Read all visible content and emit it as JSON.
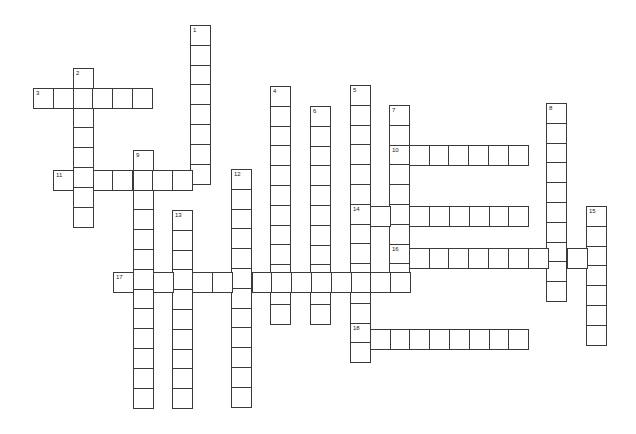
{
  "puzzle": {
    "type": "crossword",
    "cell_size": 19.8,
    "words": [
      {
        "number": "1",
        "direction": "down",
        "x": 191,
        "y": 26,
        "length": 8
      },
      {
        "number": "2",
        "direction": "down",
        "x": 74,
        "y": 69,
        "length": 8
      },
      {
        "number": "3",
        "direction": "across",
        "x": 34,
        "y": 89,
        "length": 6
      },
      {
        "number": "4",
        "direction": "down",
        "x": 271,
        "y": 87,
        "length": 12
      },
      {
        "number": "5",
        "direction": "down",
        "x": 351,
        "y": 86,
        "length": 14
      },
      {
        "number": "6",
        "direction": "down",
        "x": 311,
        "y": 107,
        "length": 11
      },
      {
        "number": "7",
        "direction": "down",
        "x": 390,
        "y": 106,
        "length": 9
      },
      {
        "number": "8",
        "direction": "down",
        "x": 547,
        "y": 104,
        "length": 10
      },
      {
        "number": "9",
        "direction": "down",
        "x": 134,
        "y": 151,
        "length": 13
      },
      {
        "number": "10",
        "direction": "across",
        "x": 390,
        "y": 146,
        "length": 7
      },
      {
        "number": "11",
        "direction": "across",
        "x": 54,
        "y": 171,
        "length": 8
      },
      {
        "number": "12",
        "direction": "down",
        "x": 232,
        "y": 170,
        "length": 12
      },
      {
        "number": "13",
        "direction": "down",
        "x": 173,
        "y": 211,
        "length": 10
      },
      {
        "number": "14",
        "direction": "across",
        "x": 351,
        "y": 207,
        "length": 9
      },
      {
        "number": "15",
        "direction": "down",
        "x": 587,
        "y": 207,
        "length": 7
      },
      {
        "number": "16",
        "direction": "across",
        "x": 390,
        "y": 249,
        "length": 11
      },
      {
        "number": "17",
        "direction": "across",
        "x": 114,
        "y": 273,
        "length": 15
      },
      {
        "number": "18",
        "direction": "across",
        "x": 351,
        "y": 330,
        "length": 9
      }
    ]
  }
}
